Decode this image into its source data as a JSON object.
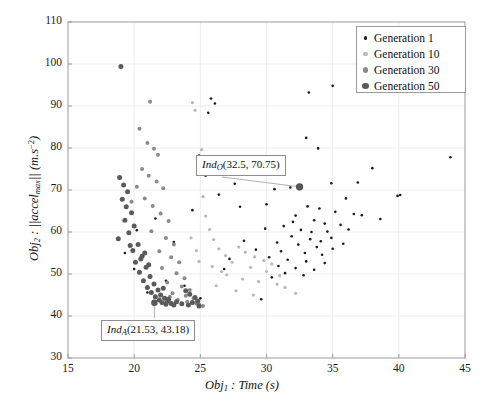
{
  "axes": {
    "xlabel_prefix": "Obj",
    "xlabel_sub": "1",
    "xlabel_rest": " : Time (s)",
    "ylabel_prefix": "Obj",
    "ylabel_sub": "2",
    "ylabel_mid": " : ||accel",
    "ylabel_mid_sub": "max",
    "ylabel_tail": "|| (m.s",
    "ylabel_sup": "−2",
    "ylabel_close": ")",
    "xticks": [
      "15",
      "20",
      "25",
      "30",
      "35",
      "40",
      "45"
    ],
    "yticks": [
      "30",
      "40",
      "50",
      "60",
      "70",
      "80",
      "90",
      "100",
      "110"
    ],
    "xlim": [
      15,
      45
    ],
    "ylim": [
      30,
      110
    ]
  },
  "legend": {
    "position": "upper-right",
    "items": [
      {
        "label": "Generation 1",
        "color": "#1a1a1a",
        "size": 2.6
      },
      {
        "label": "Generation 10",
        "color": "#b8b8b8",
        "size": 3.2
      },
      {
        "label": "Generation 30",
        "color": "#8a8a8a",
        "size": 4.0
      },
      {
        "label": "Generation 50",
        "color": "#5a5a5a",
        "size": 5.0
      }
    ]
  },
  "annotations": [
    {
      "name": "ind-o",
      "prefix": "Ind",
      "sub": "O",
      "value": "(32.5, 70.75)",
      "target": [
        32.5,
        70.75
      ]
    },
    {
      "name": "ind-a",
      "prefix": "Ind",
      "sub": "A",
      "value": "(21.53, 43.18)",
      "target": [
        21.53,
        43.18
      ]
    }
  ],
  "chart_data": {
    "type": "scatter",
    "title": "",
    "xlabel": "Obj1 : Time (s)",
    "ylabel": "Obj2 : ||accel_max|| (m.s^-2)",
    "xlim": [
      15,
      45
    ],
    "ylim": [
      30,
      110
    ],
    "grid": true,
    "series": [
      {
        "name": "Generation 1",
        "color": "#1a1a1a",
        "marker_size": 2.6,
        "points": [
          [
            43.9,
            77.8
          ],
          [
            38.0,
            75.2
          ],
          [
            39.9,
            68.6
          ],
          [
            35.0,
            94.8
          ],
          [
            33.2,
            93.2
          ],
          [
            34.9,
            71.6
          ],
          [
            36.6,
            64.3
          ],
          [
            38.6,
            63.1
          ],
          [
            33.0,
            82.4
          ],
          [
            33.9,
            79.9
          ],
          [
            31.8,
            70.6
          ],
          [
            30.6,
            70.2
          ],
          [
            33.1,
            66.1
          ],
          [
            34.0,
            65.6
          ],
          [
            35.2,
            64.8
          ],
          [
            32.2,
            63.9
          ],
          [
            33.6,
            62.8
          ],
          [
            34.4,
            62.0
          ],
          [
            35.6,
            61.7
          ],
          [
            31.3,
            61.4
          ],
          [
            32.6,
            60.5
          ],
          [
            34.6,
            60.1
          ],
          [
            36.2,
            60.6
          ],
          [
            31.9,
            59.0
          ],
          [
            33.3,
            58.3
          ],
          [
            34.9,
            58.6
          ],
          [
            30.8,
            57.5
          ],
          [
            32.4,
            57.0
          ],
          [
            33.8,
            56.4
          ],
          [
            35.0,
            56.0
          ],
          [
            31.1,
            55.4
          ],
          [
            32.9,
            55.0
          ],
          [
            34.2,
            54.6
          ],
          [
            30.2,
            54.0
          ],
          [
            31.6,
            53.4
          ],
          [
            33.0,
            53.0
          ],
          [
            34.4,
            52.6
          ],
          [
            30.9,
            51.9
          ],
          [
            32.2,
            51.4
          ],
          [
            33.6,
            51.0
          ],
          [
            31.4,
            50.2
          ],
          [
            32.8,
            49.7
          ],
          [
            30.4,
            49.2
          ],
          [
            34.1,
            57.8
          ],
          [
            35.8,
            57.2
          ],
          [
            33.4,
            60.0
          ],
          [
            32.0,
            62.4
          ],
          [
            29.9,
            60.8
          ],
          [
            36.0,
            68.0
          ],
          [
            30.0,
            66.6
          ],
          [
            28.3,
            57.9
          ],
          [
            27.6,
            71.5
          ],
          [
            25.8,
            91.8
          ],
          [
            26.1,
            90.6
          ],
          [
            25.6,
            88.4
          ],
          [
            24.9,
            78.2
          ],
          [
            25.4,
            73.4
          ],
          [
            26.4,
            68.9
          ],
          [
            28.0,
            66.0
          ],
          [
            29.2,
            55.8
          ],
          [
            27.2,
            53.6
          ],
          [
            26.8,
            51.2
          ],
          [
            24.4,
            65.2
          ],
          [
            23.0,
            57.6
          ],
          [
            21.6,
            63.2
          ],
          [
            20.2,
            60.4
          ],
          [
            19.3,
            55.0
          ],
          [
            20.0,
            51.2
          ],
          [
            22.4,
            48.4
          ],
          [
            23.8,
            47.2
          ],
          [
            21.0,
            45.6
          ],
          [
            25.0,
            44.2
          ],
          [
            29.6,
            44.0
          ],
          [
            36.9,
            71.8
          ],
          [
            37.2,
            64.0
          ],
          [
            40.1,
            68.8
          ]
        ]
      },
      {
        "name": "Generation 10",
        "color": "#b8b8b8",
        "marker_size": 3.2,
        "points": [
          [
            27.9,
            56.4
          ],
          [
            28.4,
            55.2
          ],
          [
            29.1,
            54.1
          ],
          [
            29.8,
            53.2
          ],
          [
            30.4,
            52.4
          ],
          [
            28.8,
            51.6
          ],
          [
            27.4,
            52.8
          ],
          [
            26.9,
            54.4
          ],
          [
            26.4,
            56.0
          ],
          [
            26.0,
            58.2
          ],
          [
            25.7,
            60.6
          ],
          [
            25.4,
            63.8
          ],
          [
            25.2,
            68.4
          ],
          [
            27.0,
            49.8
          ],
          [
            28.2,
            48.8
          ],
          [
            29.4,
            48.2
          ],
          [
            30.8,
            47.6
          ],
          [
            31.4,
            46.8
          ],
          [
            26.6,
            50.6
          ],
          [
            25.9,
            51.8
          ],
          [
            30.0,
            50.6
          ],
          [
            31.0,
            49.6
          ],
          [
            24.4,
            90.8
          ],
          [
            24.6,
            89.0
          ],
          [
            25.1,
            79.6
          ],
          [
            32.2,
            45.4
          ],
          [
            29.0,
            45.0
          ],
          [
            27.7,
            46.0
          ],
          [
            26.2,
            47.2
          ],
          [
            24.9,
            53.0
          ],
          [
            24.7,
            55.6
          ],
          [
            24.3,
            58.6
          ]
        ]
      },
      {
        "name": "Generation 30",
        "color": "#8a8a8a",
        "marker_size": 4.0,
        "points": [
          [
            21.2,
            91.0
          ],
          [
            21.0,
            81.2
          ],
          [
            21.5,
            79.8
          ],
          [
            21.8,
            78.4
          ],
          [
            20.6,
            75.0
          ],
          [
            21.1,
            73.4
          ],
          [
            21.7,
            72.0
          ],
          [
            22.2,
            70.4
          ],
          [
            20.8,
            68.0
          ],
          [
            21.4,
            66.2
          ],
          [
            22.0,
            64.4
          ],
          [
            22.6,
            62.6
          ],
          [
            21.3,
            60.2
          ],
          [
            22.4,
            58.6
          ],
          [
            23.0,
            57.0
          ],
          [
            21.9,
            55.4
          ],
          [
            22.8,
            54.0
          ],
          [
            23.4,
            52.8
          ],
          [
            22.1,
            51.4
          ],
          [
            23.2,
            50.2
          ],
          [
            23.8,
            49.0
          ],
          [
            22.5,
            48.0
          ],
          [
            23.6,
            47.0
          ],
          [
            24.2,
            46.2
          ],
          [
            22.9,
            45.4
          ],
          [
            23.9,
            44.8
          ],
          [
            24.5,
            44.2
          ],
          [
            23.3,
            43.8
          ],
          [
            24.0,
            43.4
          ],
          [
            24.7,
            43.0
          ],
          [
            22.7,
            44.6
          ],
          [
            24.9,
            42.8
          ],
          [
            25.2,
            42.4
          ],
          [
            20.4,
            84.6
          ],
          [
            20.2,
            70.8
          ],
          [
            19.8,
            67.2
          ]
        ]
      },
      {
        "name": "Generation 50",
        "color": "#5a5a5a",
        "marker_size": 5.0,
        "points": [
          [
            19.0,
            99.4
          ],
          [
            18.9,
            73.0
          ],
          [
            19.2,
            71.2
          ],
          [
            19.5,
            69.6
          ],
          [
            19.1,
            67.8
          ],
          [
            19.4,
            66.0
          ],
          [
            19.8,
            64.6
          ],
          [
            19.3,
            62.8
          ],
          [
            20.0,
            61.4
          ],
          [
            19.6,
            59.8
          ],
          [
            18.8,
            58.4
          ],
          [
            20.3,
            57.0
          ],
          [
            19.9,
            55.6
          ],
          [
            20.6,
            54.2
          ],
          [
            20.1,
            52.8
          ],
          [
            20.9,
            51.6
          ],
          [
            20.4,
            50.4
          ],
          [
            21.2,
            49.4
          ],
          [
            20.7,
            48.4
          ],
          [
            21.5,
            47.6
          ],
          [
            21.0,
            46.8
          ],
          [
            21.8,
            46.2
          ],
          [
            21.3,
            45.6
          ],
          [
            22.0,
            45.0
          ],
          [
            21.6,
            44.6
          ],
          [
            22.3,
            44.2
          ],
          [
            21.9,
            43.8
          ],
          [
            22.5,
            43.5
          ],
          [
            22.1,
            43.2
          ],
          [
            22.8,
            43.0
          ],
          [
            22.4,
            42.8
          ],
          [
            23.0,
            42.6
          ],
          [
            21.53,
            43.18
          ],
          [
            20.5,
            53.6
          ],
          [
            21.1,
            52.2
          ],
          [
            19.7,
            56.8
          ],
          [
            22.6,
            44.0
          ],
          [
            23.2,
            43.4
          ],
          [
            22.2,
            46.6
          ],
          [
            20.8,
            55.0
          ],
          [
            24.1,
            42.6
          ],
          [
            23.6,
            42.9
          ],
          [
            24.4,
            43.2
          ],
          [
            24.8,
            43.6
          ],
          [
            24.6,
            44.4
          ],
          [
            24.2,
            45.2
          ],
          [
            23.9,
            46.0
          ],
          [
            24.9,
            42.4
          ],
          [
            32.5,
            70.75
          ]
        ]
      }
    ]
  }
}
